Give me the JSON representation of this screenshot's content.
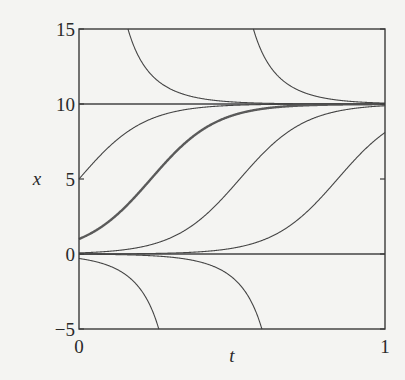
{
  "chart_data": {
    "type": "line",
    "title": "",
    "xlabel": "t",
    "ylabel": "x",
    "xlim": [
      0,
      1
    ],
    "ylim": [
      -5,
      15
    ],
    "x_ticks": [
      0,
      1
    ],
    "y_ticks": [
      -5,
      0,
      5,
      10,
      15
    ],
    "x_tick_labels": [
      "0",
      "1"
    ],
    "y_tick_labels": [
      "−5",
      "0",
      "5",
      "10",
      "15"
    ],
    "grid": false,
    "legend": null,
    "model": "logistic dx/dt = r x (1 - x/K)",
    "K": 10,
    "r": 9.35,
    "series": [
      {
        "name": "equilibrium x=10",
        "kind": "constant",
        "value": 10,
        "width": 1.3
      },
      {
        "name": "equilibrium x=0",
        "kind": "constant",
        "value": 0,
        "width": 1.3
      },
      {
        "name": "x0=5",
        "kind": "logistic",
        "x0": 5,
        "width": 1.1
      },
      {
        "name": "x0=1 (highlighted)",
        "kind": "logistic",
        "x0": 1,
        "width": 2.4
      },
      {
        "name": "crosses 5 at t=0.51",
        "kind": "logistic",
        "x0": 0.073,
        "width": 1.1
      },
      {
        "name": "crosses 5 at t=0.845",
        "kind": "logistic",
        "x0": 0.0037,
        "width": 1.1
      },
      {
        "name": "from 15 at t=0.16",
        "kind": "logistic",
        "x0": 15,
        "t0": 0.16,
        "width": 1.1
      },
      {
        "name": "from 15 at t=0.57",
        "kind": "logistic",
        "x0": 15,
        "t0": 0.57,
        "width": 1.1
      },
      {
        "name": "x0=-0.3",
        "kind": "logistic",
        "x0": -0.3,
        "width": 1.1
      },
      {
        "name": "x0=-0.0125",
        "kind": "logistic",
        "x0": -0.0125,
        "width": 1.1
      }
    ]
  },
  "colors": {
    "background": "#f4f4f2",
    "axis": "#3a3a3a",
    "curve": "#454545",
    "highlight": "#5a5a5a"
  }
}
